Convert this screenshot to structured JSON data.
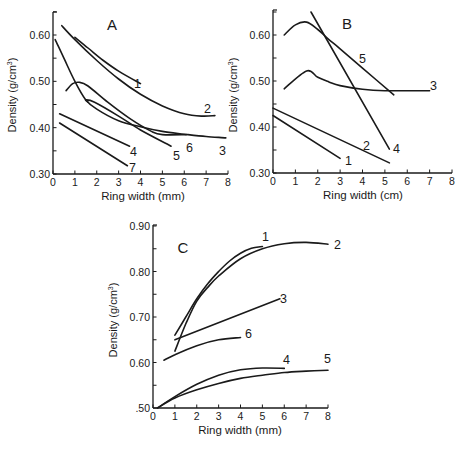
{
  "figure": {
    "ink_color": "#1a1a1a",
    "background": "#ffffff"
  },
  "chart_data": [
    {
      "panel": "A",
      "type": "line",
      "title": "A",
      "xlabel": "Ring width (mm)",
      "ylabel": "Density (g/cm3)",
      "xlim": [
        0,
        8
      ],
      "ylim": [
        0.3,
        0.65
      ],
      "xticks": [
        0,
        1,
        2,
        3,
        4,
        5,
        6,
        7,
        8
      ],
      "yticks": [
        0.3,
        0.4,
        0.5,
        0.6
      ],
      "ytick_labels": [
        "0.30",
        "0.40",
        "0.50",
        "0.60"
      ],
      "grid": false,
      "legend": "curve numbers labelled at line ends",
      "series": [
        {
          "name": "1",
          "x": [
            1.0,
            1.6,
            2.3,
            3.0,
            4.0
          ],
          "y": [
            0.595,
            0.572,
            0.545,
            0.522,
            0.495
          ]
        },
        {
          "name": "2",
          "x": [
            0.4,
            1.0,
            2.0,
            3.0,
            4.0,
            5.0,
            6.0,
            6.8,
            7.4
          ],
          "y": [
            0.62,
            0.59,
            0.545,
            0.505,
            0.472,
            0.447,
            0.43,
            0.425,
            0.426
          ]
        },
        {
          "name": "3",
          "x": [
            0.1,
            0.5,
            1.0,
            1.5,
            2.0,
            3.0,
            4.0,
            5.0,
            6.0,
            7.0,
            7.9
          ],
          "y": [
            0.59,
            0.55,
            0.5,
            0.46,
            0.44,
            0.415,
            0.402,
            0.392,
            0.386,
            0.381,
            0.378
          ]
        },
        {
          "name": "4",
          "x": [
            0.3,
            3.5
          ],
          "y": [
            0.43,
            0.36
          ]
        },
        {
          "name": "5",
          "x": [
            1.6,
            1.5,
            1.9,
            3.0,
            4.0,
            5.4
          ],
          "y": [
            0.455,
            0.46,
            0.455,
            0.425,
            0.395,
            0.36
          ]
        },
        {
          "name": "6",
          "x": [
            0.6,
            0.9,
            1.2,
            1.6,
            2.5,
            3.5,
            4.5,
            5.0,
            6.1
          ],
          "y": [
            0.48,
            0.495,
            0.498,
            0.49,
            0.455,
            0.42,
            0.392,
            0.385,
            0.385
          ]
        },
        {
          "name": "7",
          "x": [
            0.3,
            3.4
          ],
          "y": [
            0.41,
            0.318
          ]
        }
      ]
    },
    {
      "panel": "B",
      "type": "line",
      "title": "B",
      "xlabel": "Ring width (cm)",
      "ylabel": "Density (g/cm3)",
      "xlim": [
        0,
        8
      ],
      "ylim": [
        0.3,
        0.65
      ],
      "xticks": [
        0,
        1,
        2,
        3,
        4,
        5,
        6,
        7,
        8
      ],
      "yticks": [
        0.3,
        0.4,
        0.5,
        0.6
      ],
      "ytick_labels": [
        "0.30",
        "0.40",
        "0.50",
        "0.60"
      ],
      "grid": false,
      "legend": "curve numbers labelled at line ends",
      "series": [
        {
          "name": "1",
          "x": [
            0.0,
            3.0
          ],
          "y": [
            0.425,
            0.332
          ]
        },
        {
          "name": "2",
          "x": [
            0.0,
            5.2
          ],
          "y": [
            0.441,
            0.322
          ]
        },
        {
          "name": "3",
          "x": [
            0.5,
            1.5,
            2.0,
            2.5,
            3.0,
            4.0,
            5.0,
            7.0
          ],
          "y": [
            0.483,
            0.522,
            0.508,
            0.498,
            0.49,
            0.482,
            0.479,
            0.479
          ]
        },
        {
          "name": "4",
          "x": [
            1.7,
            5.2
          ],
          "y": [
            0.65,
            0.352
          ]
        },
        {
          "name": "5",
          "x": [
            0.5,
            1.0,
            1.5,
            2.0,
            2.5,
            3.0,
            4.0,
            5.4
          ],
          "y": [
            0.6,
            0.622,
            0.628,
            0.612,
            0.59,
            0.57,
            0.528,
            0.47
          ]
        }
      ]
    },
    {
      "panel": "C",
      "type": "line",
      "title": "C",
      "xlabel": "Ring width (mm)",
      "ylabel": "Density (g/cm3)",
      "xlim": [
        0,
        8
      ],
      "ylim": [
        0.5,
        0.9
      ],
      "xticks": [
        0,
        1,
        2,
        3,
        4,
        5,
        6,
        7,
        8
      ],
      "yticks": [
        0.5,
        0.6,
        0.7,
        0.8,
        0.9
      ],
      "ytick_labels": [
        ".50",
        "0.60",
        "0.70",
        "0.80",
        "0.90"
      ],
      "grid": false,
      "legend": "curve numbers labelled at line ends",
      "series": [
        {
          "name": "1",
          "x": [
            1.0,
            1.5,
            2.0,
            2.5,
            3.0,
            3.5,
            4.0,
            4.5,
            5.0
          ],
          "y": [
            0.66,
            0.7,
            0.74,
            0.773,
            0.8,
            0.823,
            0.84,
            0.851,
            0.855
          ]
        },
        {
          "name": "2",
          "x": [
            1.0,
            1.5,
            2.0,
            2.5,
            3.0,
            4.0,
            5.0,
            6.0,
            7.0,
            8.0
          ],
          "y": [
            0.625,
            0.685,
            0.735,
            0.765,
            0.79,
            0.828,
            0.85,
            0.861,
            0.864,
            0.86
          ]
        },
        {
          "name": "3",
          "x": [
            1.0,
            5.8
          ],
          "y": [
            0.65,
            0.74
          ]
        },
        {
          "name": "4",
          "x": [
            0.2,
            1.0,
            2.0,
            3.0,
            4.0,
            5.0,
            6.0
          ],
          "y": [
            0.5,
            0.525,
            0.552,
            0.572,
            0.584,
            0.588,
            0.587
          ]
        },
        {
          "name": "5",
          "x": [
            0.2,
            1.0,
            2.0,
            3.0,
            4.0,
            5.0,
            6.0,
            7.0,
            8.0
          ],
          "y": [
            0.5,
            0.522,
            0.54,
            0.554,
            0.565,
            0.572,
            0.578,
            0.581,
            0.583
          ]
        },
        {
          "name": "6",
          "x": [
            0.5,
            1.0,
            2.0,
            3.0,
            4.0
          ],
          "y": [
            0.605,
            0.617,
            0.637,
            0.65,
            0.655
          ]
        }
      ]
    }
  ],
  "layout": {
    "panels": [
      {
        "id": "A",
        "x0": 53,
        "x1": 228,
        "yAxisTop": 12,
        "yBottom": 174,
        "yTopVal": 0.6,
        "yTopPx": 35,
        "title_pos": [
          112,
          30
        ],
        "labels": [
          {
            "t": "1",
            "x": 134,
            "y": 88
          },
          {
            "t": "2",
            "x": 204,
            "y": 113
          },
          {
            "t": "3",
            "x": 219,
            "y": 155
          },
          {
            "t": "4",
            "x": 130,
            "y": 156
          },
          {
            "t": "5",
            "x": 173,
            "y": 160
          },
          {
            "t": "6",
            "x": 186,
            "y": 152
          },
          {
            "t": "7",
            "x": 129,
            "y": 172
          }
        ],
        "ylabel_x": 16,
        "ylabel_y": 95,
        "xlabel_x": 143,
        "xlabel_y": 200
      },
      {
        "id": "B",
        "x0": 273,
        "x1": 452,
        "yAxisTop": 10,
        "yBottom": 173,
        "yTopVal": 0.6,
        "yTopPx": 35,
        "title_pos": [
          347,
          29
        ],
        "labels": [
          {
            "t": "1",
            "x": 345,
            "y": 165
          },
          {
            "t": "2",
            "x": 363,
            "y": 150
          },
          {
            "t": "3",
            "x": 430,
            "y": 90
          },
          {
            "t": "4",
            "x": 393,
            "y": 153
          },
          {
            "t": "5",
            "x": 359,
            "y": 63
          }
        ],
        "ylabel_x": 237,
        "ylabel_y": 95,
        "xlabel_x": 363,
        "xlabel_y": 199
      },
      {
        "id": "C",
        "x0": 153,
        "x1": 328,
        "yAxisTop": 225,
        "yBottom": 408,
        "yTopVal": 0.9,
        "yTopPx": 226,
        "title_pos": [
          183,
          253
        ],
        "labels": [
          {
            "t": "1",
            "x": 262,
            "y": 241
          },
          {
            "t": "2",
            "x": 334,
            "y": 249
          },
          {
            "t": "3",
            "x": 280,
            "y": 303
          },
          {
            "t": "6",
            "x": 245,
            "y": 338
          },
          {
            "t": "4",
            "x": 283,
            "y": 364
          },
          {
            "t": "5",
            "x": 324,
            "y": 363
          }
        ],
        "ylabel_x": 117,
        "ylabel_y": 320,
        "xlabel_x": 240,
        "xlabel_y": 434
      }
    ]
  }
}
